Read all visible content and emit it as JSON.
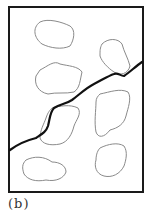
{
  "figure": {
    "caption": "(b)",
    "colors": {
      "frame": "#1a1a1a",
      "crack": "#111111",
      "inclusion": "#8a8a8a",
      "background": "#ffffff"
    }
  },
  "diagram": {
    "frame": {
      "x": 9,
      "y": 7,
      "width": 134,
      "height": 185
    },
    "inclusions": [
      {
        "id": "inclusion-1",
        "d": "M40,22 C48,18 62,22 70,26 C76,30 74,40 70,46 C62,50 50,48 42,44 C34,38 32,28 40,22 Z"
      },
      {
        "id": "inclusion-2",
        "d": "M102,44 C108,38 118,38 122,44 C124,52 128,58 130,66 C128,74 120,76 114,72 C108,68 102,62 100,56 C100,50 100,48 102,44 Z"
      },
      {
        "id": "inclusion-3",
        "d": "M40,70 C48,66 54,60 60,64 C68,66 78,66 82,72 C80,80 80,88 74,92 C66,94 56,92 48,94 C38,92 34,84 36,76 Z"
      },
      {
        "id": "inclusion-4",
        "d": "M100,94 C110,92 120,88 128,92 C132,98 128,108 126,116 C124,124 118,128 110,130 C104,138 98,138 96,132 C94,122 96,110 96,102 C96,98 98,96 100,94 Z"
      },
      {
        "id": "inclusion-5",
        "d": "M52,108 C60,106 70,104 78,108 C82,114 76,120 74,126 C72,134 68,142 60,144 C50,146 42,144 40,138 C40,130 44,124 46,118 C48,112 50,110 52,108 Z"
      },
      {
        "id": "inclusion-6",
        "d": "M100,148 C108,144 118,142 124,146 C128,152 126,160 124,166 C120,174 112,178 104,176 C96,174 94,166 96,160 C96,154 98,150 100,148 Z"
      },
      {
        "id": "inclusion-7",
        "d": "M26,160 C34,156 44,156 52,162 C60,162 66,166 66,172 C64,178 56,182 46,180 C36,182 28,180 24,174 C22,168 22,164 26,160 Z"
      }
    ],
    "crack": {
      "d": "M10,150 C18,144 28,140 36,138 C42,134 46,132 48,126 C50,118 50,112 54,108 C60,104 66,104 72,100 C80,94 86,88 94,84 C102,80 108,76 114,74 C118,72 120,76 124,76 C130,72 136,66 142,62"
    }
  }
}
